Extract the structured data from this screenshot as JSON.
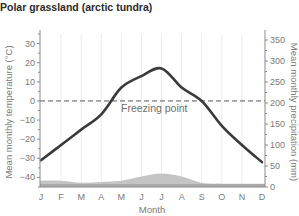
{
  "title": "Polar grassland (arctic tundra)",
  "annotation": "Freezing point",
  "colors": {
    "temperature_line": "#3a3a3a",
    "precipitation_fill": "#c4c4c4",
    "precipitation_base": "#a9a9a9",
    "grid": "#ececec",
    "axis": "#8a8a8a",
    "freezing_line": "#555555"
  },
  "chart_data": {
    "type": "line+area",
    "title": "Polar grassland (arctic tundra)",
    "xlabel": "Month",
    "ylabel": "Mean monthly temperature (°C)",
    "y2label": "Mean monthly precipitation (mm)",
    "categories": [
      "J",
      "F",
      "M",
      "A",
      "M",
      "J",
      "J",
      "A",
      "S",
      "O",
      "N",
      "D"
    ],
    "ylim": [
      -45,
      35
    ],
    "y2lim": [
      0,
      350
    ],
    "yticks": [
      -40,
      -30,
      -20,
      -10,
      0,
      10,
      20,
      30
    ],
    "y2ticks": [
      0,
      50,
      100,
      150,
      200,
      250,
      300,
      350
    ],
    "grid": "vertical",
    "annotations": [
      {
        "text": "Freezing point",
        "y": 0,
        "style": "dashed"
      }
    ],
    "series": [
      {
        "name": "Mean monthly temperature (°C)",
        "type": "line",
        "axis": "left",
        "values": [
          -31,
          -23,
          -15,
          -7,
          7,
          13,
          17,
          7,
          0,
          -13,
          -23,
          -32
        ]
      },
      {
        "name": "Mean monthly precipitation (mm)",
        "type": "area",
        "axis": "right",
        "values": [
          15,
          15,
          10,
          12,
          15,
          25,
          32,
          25,
          10,
          8,
          8,
          8
        ]
      }
    ]
  }
}
